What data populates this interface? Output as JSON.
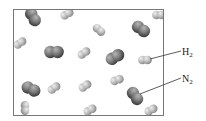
{
  "diagram": {
    "title": "",
    "container": {
      "x": 13,
      "y": 9,
      "width": 150,
      "height": 106,
      "stroke": "#777777"
    },
    "colors": {
      "n2_dark": "#3e3e3e",
      "n2_mid": "#7a7a7a",
      "n2_light": "#b5b5b5",
      "h2_dark": "#8a8a8a",
      "h2_mid": "#bdbdbd",
      "h2_light": "#eeeeee",
      "leader_line": "#333333"
    },
    "molecules": {
      "N2": [
        {
          "cx": 33,
          "cy": 17,
          "angle": 60
        },
        {
          "cx": 54,
          "cy": 52,
          "angle": 0
        },
        {
          "cx": 141,
          "cy": 29,
          "angle": 35
        },
        {
          "cx": 115,
          "cy": 57,
          "angle": -30
        },
        {
          "cx": 31,
          "cy": 89,
          "angle": 25
        },
        {
          "cx": 135,
          "cy": 96,
          "angle": 55
        }
      ],
      "H2": [
        {
          "cx": 67,
          "cy": 14,
          "angle": -30
        },
        {
          "cx": 159,
          "cy": 15,
          "angle": 0
        },
        {
          "cx": 99,
          "cy": 30,
          "angle": 40
        },
        {
          "cx": 20,
          "cy": 43,
          "angle": -35
        },
        {
          "cx": 84,
          "cy": 53,
          "angle": -35
        },
        {
          "cx": 145,
          "cy": 60,
          "angle": 0
        },
        {
          "cx": 54,
          "cy": 88,
          "angle": -35
        },
        {
          "cx": 85,
          "cy": 86,
          "angle": -35
        },
        {
          "cx": 117,
          "cy": 80,
          "angle": -20
        },
        {
          "cx": 25,
          "cy": 108,
          "angle": 90
        },
        {
          "cx": 90,
          "cy": 110,
          "angle": -30
        },
        {
          "cx": 151,
          "cy": 110,
          "angle": -30
        }
      ]
    },
    "labels": [
      {
        "id": "h2",
        "species": "H",
        "subscript": "2",
        "text_x": 182,
        "text_y": 47,
        "line": [
          150,
          59,
          181,
          51
        ]
      },
      {
        "id": "n2",
        "species": "N",
        "subscript": "2",
        "text_x": 182,
        "text_y": 74,
        "line": [
          140,
          94,
          181,
          78
        ]
      }
    ]
  }
}
